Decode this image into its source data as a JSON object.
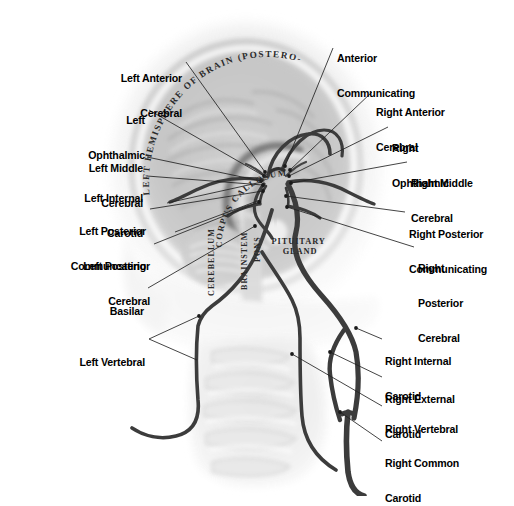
{
  "figure": {
    "kind": "anatomical-illustration",
    "background_color": "#ffffff",
    "ink_color": "#1a1a1a",
    "vessel_color": "#3c3c3c",
    "tissue_color": "#b9b9b9",
    "label_color": "#000000",
    "leader_color": "#222222"
  },
  "internal_labels": [
    {
      "id": "hemisphere",
      "text": "LEFT HEMISPHERE OF BRAIN (POSTERO-MEDIAL VIEW)",
      "style": "serif-caps-curved"
    },
    {
      "id": "corpus-callosum",
      "text": "CORPUS CALLOSUM",
      "style": "serif-caps-curved"
    },
    {
      "id": "cerebellum",
      "text": "CEREBELLUM",
      "style": "serif-caps-vertical"
    },
    {
      "id": "brainstem",
      "text": "BRAINSTEM",
      "style": "serif-caps-vertical"
    },
    {
      "id": "pons",
      "text": "PONS",
      "style": "serif-caps-vertical"
    },
    {
      "id": "pituitary-gland",
      "text": "PITUITARY\nGLAND",
      "style": "serif-caps"
    }
  ],
  "labels_left": [
    {
      "id": "left-anterior-cerebral",
      "lines": [
        "Left Anterior",
        "Cerebral"
      ],
      "x": 182,
      "y": 50,
      "leader": [
        [
          186,
          62
        ],
        [
          262,
          172
        ]
      ]
    },
    {
      "id": "left-ophthalmic",
      "lines": [
        "Left",
        "Ophthalmic"
      ],
      "x": 145,
      "y": 92,
      "leader": [
        [
          149,
          110
        ],
        [
          266,
          176
        ]
      ]
    },
    {
      "id": "left-middle-cerebral",
      "lines": [
        "Left Middle",
        "Cerebral"
      ],
      "x": 143,
      "y": 140,
      "leader": [
        [
          147,
          157
        ],
        [
          261,
          180
        ]
      ]
    },
    {
      "id": "left-internal-carotid",
      "lines": [
        "Left Internal",
        "Carotid"
      ],
      "x": 143,
      "y": 170,
      "leader": [
        [
          147,
          176
        ],
        [
          264,
          184
        ]
      ]
    },
    {
      "id": "left-posterior-communicating",
      "lines": [
        "Left Posterior",
        "Communcating"
      ],
      "x": 146,
      "y": 203,
      "leader": [
        [
          150,
          209
        ],
        [
          262,
          192
        ]
      ]
    },
    {
      "id": "left-posterior-cerebral",
      "lines": [
        "Left Posterior",
        "Cerebral"
      ],
      "x": 150,
      "y": 238,
      "leader": [
        [
          154,
          244
        ],
        [
          260,
          200
        ]
      ]
    },
    {
      "id": "basilar",
      "lines": [
        "Basilar"
      ],
      "x": 144,
      "y": 283,
      "leader": [
        [
          148,
          288
        ],
        [
          254,
          225
        ]
      ]
    },
    {
      "id": "left-vertebral",
      "lines": [
        "Left Vertebral"
      ],
      "x": 145,
      "y": 334,
      "leader": [
        [
          149,
          339
        ],
        [
          200,
          318
        ]
      ]
    }
  ],
  "labels_right": [
    {
      "id": "anterior-communicating",
      "lines": [
        "Anterior",
        "Communicating"
      ],
      "x": 335,
      "y": 30,
      "leader": [
        [
          333,
          48
        ],
        [
          284,
          167
        ]
      ]
    },
    {
      "id": "right-anterior-cerebral",
      "lines": [
        "Right Anterior",
        "Cerebral"
      ],
      "x": 376,
      "y": 84,
      "leader": [
        [
          373,
          92
        ],
        [
          289,
          170
        ]
      ]
    },
    {
      "id": "right-ophthalmic",
      "lines": [
        "Right",
        "Ophthalmic"
      ],
      "x": 392,
      "y": 120,
      "leader": [
        [
          389,
          127
        ],
        [
          288,
          176
        ]
      ]
    },
    {
      "id": "right-middle-cerebral",
      "lines": [
        "Right Middle",
        "Cerebral"
      ],
      "x": 411,
      "y": 155,
      "leader": [
        [
          408,
          162
        ],
        [
          290,
          182
        ]
      ]
    },
    {
      "id": "right-posterior-communicating",
      "lines": [
        "Right Posterior",
        "Communicating"
      ],
      "x": 409,
      "y": 206,
      "leader": [
        [
          406,
          212
        ],
        [
          285,
          196
        ]
      ]
    },
    {
      "id": "right-posterior-cerebral",
      "lines": [
        "Right",
        "Posterior",
        "Cerebral"
      ],
      "x": 418,
      "y": 240,
      "leader": [
        [
          415,
          247
        ],
        [
          286,
          206
        ]
      ]
    },
    {
      "id": "right-internal-carotid",
      "lines": [
        "Right Internal",
        "Carotid"
      ],
      "x": 385,
      "y": 333,
      "leader": [
        [
          382,
          339
        ],
        [
          356,
          329
        ]
      ]
    },
    {
      "id": "right-external-carotid",
      "lines": [
        "Right External",
        "Carotid"
      ],
      "x": 385,
      "y": 371,
      "leader": [
        [
          382,
          377
        ],
        [
          330,
          353
        ]
      ]
    },
    {
      "id": "right-vertebral",
      "lines": [
        "Right Vertebral"
      ],
      "x": 385,
      "y": 401,
      "leader": [
        [
          382,
          406
        ],
        [
          292,
          355
        ]
      ]
    },
    {
      "id": "right-common-carotid",
      "lines": [
        "Right Common",
        "Carotid"
      ],
      "x": 385,
      "y": 435,
      "leader": [
        [
          382,
          441
        ],
        [
          339,
          413
        ]
      ]
    }
  ]
}
